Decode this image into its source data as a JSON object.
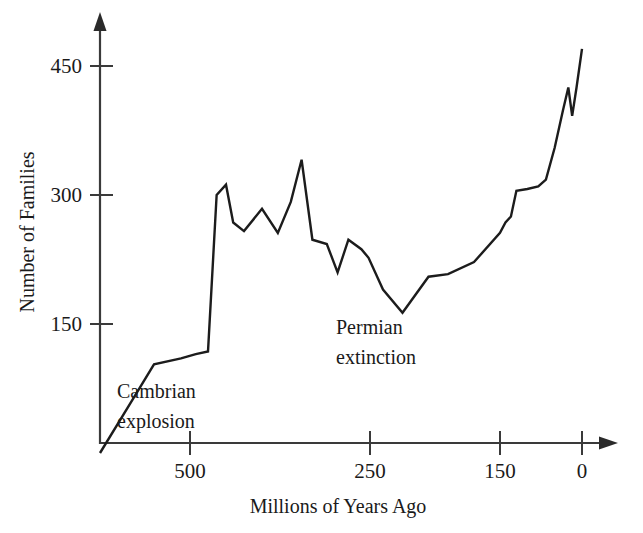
{
  "chart_data": {
    "type": "line",
    "title": "",
    "xlabel": "Millions of Years Ago",
    "ylabel": "Number of Families",
    "xlim": [
      600,
      -15
    ],
    "ylim": [
      0,
      490
    ],
    "x_ticks": [
      500,
      250,
      150,
      0
    ],
    "x_tick_labels": [
      "500",
      "250",
      "150",
      "0"
    ],
    "y_ticks": [
      150,
      300,
      450
    ],
    "y_tick_labels": [
      "150",
      "300",
      "450"
    ],
    "x_axis_direction": "decreasing",
    "grid": false,
    "legend": null,
    "series": [
      {
        "name": "Number of marine animal families",
        "x": [
          600,
          565,
          540,
          510,
          492,
          475,
          463,
          450,
          440,
          425,
          400,
          378,
          360,
          345,
          330,
          310,
          295,
          280,
          262,
          252,
          240,
          225,
          205,
          190,
          170,
          150,
          140,
          130,
          120,
          100,
          80,
          66,
          50,
          35,
          25,
          18,
          10,
          0
        ],
        "y": [
          0,
          60,
          103,
          110,
          115,
          118,
          300,
          312,
          268,
          258,
          284,
          256,
          292,
          341,
          248,
          243,
          210,
          248,
          237,
          227,
          190,
          163,
          205,
          208,
          222,
          256,
          268,
          275,
          305,
          307,
          310,
          318,
          355,
          398,
          425,
          392,
          425,
          470
        ]
      }
    ],
    "annotations": [
      {
        "text_line1": "Cambrian",
        "text_line2": "explosion",
        "x_myr": 530,
        "y_value": 78
      },
      {
        "text_line1": "Permian",
        "text_line2": "extinction",
        "x_myr": 232,
        "y_value": 128
      }
    ]
  },
  "axis": {
    "y_label": "Number of Families",
    "y_ticks": [
      "450",
      "300",
      "150"
    ],
    "x_label": "Millions of Years Ago",
    "x_ticks": [
      "500",
      "250",
      "150",
      "0"
    ]
  },
  "annotations": {
    "cambrian_line1": "Cambrian",
    "cambrian_line2": "explosion",
    "permian_line1": "Permian",
    "permian_line2": "extinction"
  },
  "colors": {
    "background": "#ffffff",
    "line": "#1c1c1c",
    "axis": "#3a3a3a",
    "text": "#1a1a1a"
  }
}
